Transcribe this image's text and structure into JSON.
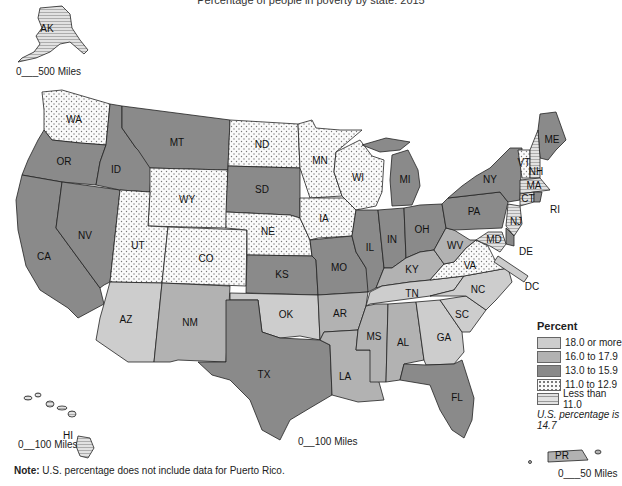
{
  "title": "Percentage of people in poverty by state: 2015",
  "legend": {
    "title": "Percent",
    "items": [
      {
        "label": "18.0 or more",
        "class": "c18",
        "color": "#cdcdcd"
      },
      {
        "label": "16.0 to 17.9",
        "class": "c16",
        "color": "#b2b2b2"
      },
      {
        "label": "13.0 to 15.9",
        "class": "c13",
        "color": "#8a8a8a"
      },
      {
        "label": "11.0 to 12.9",
        "class": "c11",
        "color": "dotted"
      },
      {
        "label": "Less than 11.0",
        "class": "clt",
        "color": "striped"
      }
    ],
    "us_note": "U.S. percentage is 14.7"
  },
  "scales": {
    "alaska": "0___500 Miles",
    "hawaii": "0__100 Miles",
    "mainland": "0__100 Miles",
    "puerto_rico": "0___50 Miles"
  },
  "footnote": {
    "prefix": "Note:",
    "text": " U.S. percentage does not include data for Puerto Rico."
  },
  "chart_data": {
    "type": "choropleth",
    "title": "Percentage of people in poverty by state: 2015",
    "legend_title": "Percent",
    "categories": [
      "18.0 or more",
      "16.0 to 17.9",
      "13.0 to 15.9",
      "11.0 to 12.9",
      "Less than 11.0"
    ],
    "us_percentage": 14.7,
    "states": {
      "AK": "Less than 11.0",
      "HI": "Less than 11.0",
      "WA": "11.0 to 12.9",
      "OR": "13.0 to 15.9",
      "CA": "13.0 to 15.9",
      "NV": "13.0 to 15.9",
      "ID": "13.0 to 15.9",
      "MT": "13.0 to 15.9",
      "WY": "11.0 to 12.9",
      "UT": "11.0 to 12.9",
      "CO": "11.0 to 12.9",
      "AZ": "18.0 or more",
      "NM": "16.0 to 17.9",
      "ND": "11.0 to 12.9",
      "SD": "13.0 to 15.9",
      "NE": "11.0 to 12.9",
      "KS": "13.0 to 15.9",
      "OK": "18.0 or more",
      "TX": "13.0 to 15.9",
      "MN": "Less than 11.0",
      "IA": "11.0 to 12.9",
      "MO": "13.0 to 15.9",
      "AR": "16.0 to 17.9",
      "LA": "16.0 to 17.9",
      "WI": "11.0 to 12.9",
      "IL": "13.0 to 15.9",
      "MI": "13.0 to 15.9",
      "IN": "13.0 to 15.9",
      "OH": "13.0 to 15.9",
      "KY": "16.0 to 17.9",
      "TN": "18.0 or more",
      "MS": "16.0 to 17.9",
      "AL": "16.0 to 17.9",
      "GA": "18.0 or more",
      "FL": "13.0 to 15.9",
      "SC": "18.0 or more",
      "NC": "18.0 or more",
      "VA": "11.0 to 12.9",
      "WV": "16.0 to 17.9",
      "PA": "13.0 to 15.9",
      "NY": "13.0 to 15.9",
      "ME": "13.0 to 15.9",
      "VT": "Less than 11.0",
      "NH": "Less than 11.0",
      "MA": "Less than 11.0",
      "CT": "Less than 11.0",
      "RI": "13.0 to 15.9",
      "NJ": "Less than 11.0",
      "DE": "13.0 to 15.9",
      "MD": "Less than 11.0",
      "DC": "18.0 or more",
      "PR": "16.0 to 17.9"
    }
  },
  "states": [
    {
      "abbr": "AK",
      "cls": "clt",
      "pts": "40,8 62,6 70,14 72,28 80,40 88,50 84,54 70,42 60,44 50,52 36,58 18,62 22,58 34,52 40,44 36,36 42,28 38,18",
      "lx": 47,
      "ly": 29
    },
    {
      "abbr": "WA",
      "cls": "c11",
      "pts": "42,92 62,90 110,104 106,145 80,143 52,140 44,130 44,110",
      "lx": 74,
      "ly": 120
    },
    {
      "abbr": "OR",
      "cls": "c13",
      "pts": "44,130 52,140 80,143 106,145 100,162 96,185 62,182 22,175 28,160 38,140",
      "lx": 64,
      "ly": 162
    },
    {
      "abbr": "CA",
      "cls": "c13",
      "pts": "22,175 62,182 56,228 100,288 104,304 78,318 68,308 40,290 26,266 18,230 16,200",
      "lx": 44,
      "ly": 257
    },
    {
      "abbr": "NV",
      "cls": "c13",
      "pts": "62,182 120,190 110,282 104,285 100,288 56,228",
      "lx": 85,
      "ly": 236
    },
    {
      "abbr": "ID",
      "cls": "c13",
      "pts": "110,104 122,106 122,128 136,148 152,152 150,192 120,190 96,185 100,162 106,145",
      "lx": 116,
      "ly": 170
    },
    {
      "abbr": "MT",
      "cls": "c13",
      "pts": "122,106 230,120 228,170 150,168 138,150 136,148 122,128",
      "lx": 177,
      "ly": 143
    },
    {
      "abbr": "WY",
      "cls": "c11",
      "pts": "150,168 228,170 226,228 148,226 150,192",
      "lx": 187,
      "ly": 200
    },
    {
      "abbr": "UT",
      "cls": "c11",
      "pts": "120,190 150,192 148,226 168,227 162,283 110,282",
      "lx": 138,
      "ly": 246
    },
    {
      "abbr": "CO",
      "cls": "c11",
      "pts": "168,227 247,230 246,286 162,283",
      "lx": 206,
      "ly": 259
    },
    {
      "abbr": "AZ",
      "cls": "c18",
      "pts": "110,282 162,283 154,362 128,362 96,340 100,318 104,304",
      "lx": 126,
      "ly": 320
    },
    {
      "abbr": "NM",
      "cls": "c16",
      "pts": "162,283 230,286 226,362 178,360 170,362 154,362",
      "lx": 190,
      "ly": 323
    },
    {
      "abbr": "ND",
      "cls": "c11",
      "pts": "230,120 298,124 300,168 228,166",
      "lx": 262,
      "ly": 145
    },
    {
      "abbr": "SD",
      "cls": "c13",
      "pts": "228,166 300,168 300,218 290,215 226,212",
      "lx": 262,
      "ly": 190
    },
    {
      "abbr": "NE",
      "cls": "c11",
      "pts": "226,212 290,215 300,218 310,240 312,256 247,255 247,230 226,228",
      "lx": 268,
      "ly": 232
    },
    {
      "abbr": "KS",
      "cls": "c13",
      "pts": "247,255 312,256 316,260 318,295 246,293",
      "lx": 282,
      "ly": 275
    },
    {
      "abbr": "OK",
      "cls": "c18",
      "pts": "230,293 318,295 320,340 300,336 280,338 262,332 258,300 230,300",
      "lx": 286,
      "ly": 315
    },
    {
      "abbr": "TX",
      "cls": "c13",
      "pts": "226,300 258,300 262,332 280,338 320,340 330,345 332,395 310,408 290,420 280,440 262,430 250,400 230,380 212,375 198,362 226,362",
      "lx": 264,
      "ly": 375
    },
    {
      "abbr": "MN",
      "cls": "c11",
      "pts": "298,124 312,120 316,128 340,130 362,130 336,152 334,172 342,196 310,198 300,168",
      "lx": 320,
      "ly": 161
    },
    {
      "abbr": "IA",
      "cls": "c11",
      "pts": "300,198 344,198 356,210 352,236 318,238 310,240 300,218",
      "lx": 324,
      "ly": 219
    },
    {
      "abbr": "MO",
      "cls": "c13",
      "pts": "310,240 352,236 356,252 366,268 372,282 368,292 318,295 316,260 312,256",
      "lx": 339,
      "ly": 268
    },
    {
      "abbr": "AR",
      "cls": "c16",
      "pts": "318,295 368,292 366,306 358,330 324,332 320,340",
      "lx": 340,
      "ly": 314
    },
    {
      "abbr": "LA",
      "cls": "c16",
      "pts": "320,340 324,332 358,330 356,350 370,350 384,400 358,402 332,395 330,345",
      "lx": 345,
      "ly": 377
    },
    {
      "abbr": "WI",
      "cls": "c11",
      "pts": "336,152 360,140 372,156 384,160 382,192 376,206 356,210 344,198 342,196 334,172",
      "lx": 358,
      "ly": 178
    },
    {
      "abbr": "IL",
      "cls": "c13",
      "pts": "356,210 378,210 384,268 376,288 368,292 366,268 356,252 352,236",
      "lx": 370,
      "ly": 248
    },
    {
      "abbr": "MI",
      "cls": "c13",
      "pts": "392,155 408,150 418,170 420,186 412,205 392,206 390,180",
      "lx": 405,
      "ly": 180
    },
    {
      "abbr": "MIU",
      "cls": "c13",
      "pts": "362,145 386,138 410,142 400,150 380,152",
      "lx": 0,
      "ly": 0
    },
    {
      "abbr": "IN",
      "cls": "c13",
      "pts": "378,210 404,208 406,258 392,268 384,268",
      "lx": 392,
      "ly": 240
    },
    {
      "abbr": "OH",
      "cls": "c13",
      "pts": "404,208 420,205 442,204 446,228 434,250 420,252 406,258",
      "lx": 422,
      "ly": 230
    },
    {
      "abbr": "KY",
      "cls": "c16",
      "pts": "376,288 384,268 392,268 406,258 420,252 434,250 444,264 430,280 410,282 382,286",
      "lx": 412,
      "ly": 270
    },
    {
      "abbr": "TN",
      "cls": "c18",
      "pts": "366,306 370,292 382,286 410,282 430,280 464,276 454,290 430,296 370,304",
      "lx": 412,
      "ly": 294
    },
    {
      "abbr": "MS",
      "cls": "c16",
      "pts": "358,330 366,306 376,304 388,304 386,382 370,382 370,350 356,350",
      "lx": 374,
      "ly": 337
    },
    {
      "abbr": "AL",
      "cls": "c16",
      "pts": "388,304 416,302 424,360 404,364 400,380 386,382",
      "lx": 403,
      "ly": 343
    },
    {
      "abbr": "GA",
      "cls": "c18",
      "pts": "416,302 440,300 462,332 464,352 454,364 426,365 424,360",
      "lx": 444,
      "ly": 338
    },
    {
      "abbr": "FL",
      "cls": "c13",
      "pts": "400,380 404,364 426,365 454,364 462,360 474,398 472,420 464,438 452,430 440,410 430,385 412,382",
      "lx": 457,
      "ly": 398
    },
    {
      "abbr": "SC",
      "cls": "c18",
      "pts": "440,300 466,296 486,310 470,332 462,332",
      "lx": 462,
      "ly": 315
    },
    {
      "abbr": "NC",
      "cls": "c18",
      "pts": "430,296 454,290 464,276 508,268 512,282 496,300 486,310 466,296",
      "lx": 478,
      "ly": 290
    },
    {
      "abbr": "VA",
      "cls": "c11",
      "pts": "430,280 444,264 454,262 466,248 476,240 488,246 496,262 508,268 464,276",
      "lx": 470,
      "ly": 266
    },
    {
      "abbr": "WV",
      "cls": "c16",
      "pts": "434,250 446,228 454,230 470,240 476,240 466,248 454,262 444,264",
      "lx": 455,
      "ly": 246
    },
    {
      "abbr": "PA",
      "cls": "c13",
      "pts": "442,204 448,198 500,192 508,202 502,228 454,230 446,228",
      "lx": 474,
      "ly": 212
    },
    {
      "abbr": "NY",
      "cls": "c13",
      "pts": "448,198 462,186 476,176 490,168 510,148 522,148 520,200 508,202 500,192",
      "lx": 490,
      "ly": 180
    },
    {
      "abbr": "ME",
      "cls": "c13",
      "pts": "540,114 556,112 566,140 556,150 548,160 540,158 538,130",
      "lx": 552,
      "ly": 140
    },
    {
      "abbr": "VT",
      "cls": "c11",
      "pts": "518,150 530,150 530,178 522,178",
      "lx": 524,
      "ly": 163
    },
    {
      "abbr": "NH",
      "cls": "clt",
      "pts": "530,150 538,130 540,158 540,178 530,178",
      "lx": 536,
      "ly": 172
    },
    {
      "abbr": "MA",
      "cls": "clt",
      "pts": "520,180 540,178 550,190 534,192 520,194",
      "lx": 534,
      "ly": 186
    },
    {
      "abbr": "CT",
      "cls": "clt",
      "pts": "520,194 534,192 534,202 520,206",
      "lx": 528,
      "ly": 199
    },
    {
      "abbr": "RI",
      "cls": "c13",
      "pts": "534,192 542,192 540,202 534,202",
      "lx": 555,
      "ly": 210
    },
    {
      "abbr": "NJ",
      "cls": "clt",
      "pts": "508,204 520,206 522,224 514,236 506,226",
      "lx": 516,
      "ly": 222
    },
    {
      "abbr": "DE",
      "cls": "c13",
      "pts": "506,228 514,236 514,246 506,244",
      "lx": 526,
      "ly": 252
    },
    {
      "abbr": "MD",
      "cls": "clt",
      "pts": "476,240 488,232 502,232 506,244 500,252 490,246",
      "lx": 494,
      "ly": 240
    },
    {
      "abbr": "DC",
      "cls": "c18",
      "pts": "498,256 528,276 524,282 494,262",
      "lx": 532,
      "ly": 287
    },
    {
      "abbr": "HI",
      "cls": "clt",
      "pts": "78,436 90,438 94,448 88,458 80,456 76,446",
      "lx": 68,
      "ly": 436
    },
    {
      "abbr": "PR",
      "cls": "c16",
      "pts": "548,452 582,450 588,460 548,462",
      "lx": 562,
      "ly": 456
    }
  ]
}
